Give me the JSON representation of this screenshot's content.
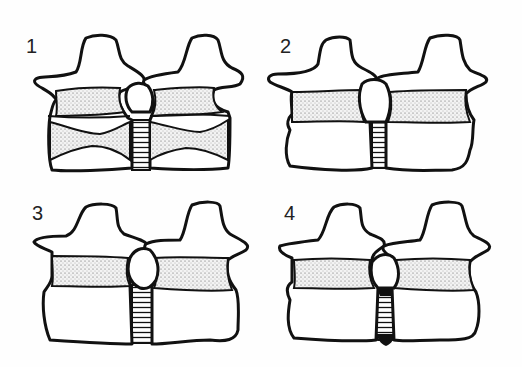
{
  "figure": {
    "type": "schematic line drawing",
    "panels": [
      {
        "label": "1",
        "position": "top-left",
        "features": [
          "stippled band under processes",
          "stippled vertebral bodies with concave end-plate lines",
          "hatched intervertebral gap",
          "joint between processes"
        ]
      },
      {
        "label": "2",
        "position": "top-right",
        "features": [
          "stippled band",
          "plain vertebral bodies",
          "narrow hatched gap"
        ]
      },
      {
        "label": "3",
        "position": "bottom-left",
        "features": [
          "stippled band",
          "plain vertebral bodies",
          "rounded joint",
          "wider hatched gap"
        ]
      },
      {
        "label": "4",
        "position": "bottom-right",
        "features": [
          "stippled band",
          "plain vertebral bodies",
          "hatched gap with blackened (calcified) ends"
        ]
      }
    ]
  },
  "colors": {
    "ink": "#111111",
    "paper": "#fefefe"
  }
}
